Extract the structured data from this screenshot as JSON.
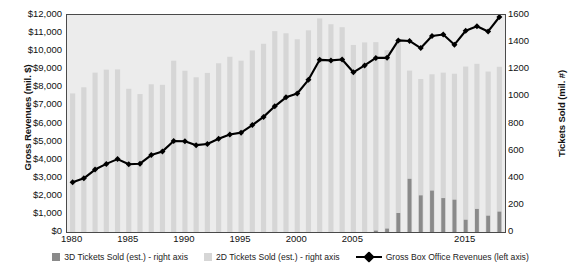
{
  "chart_data": {
    "type": "bar",
    "title": "",
    "subtitle": "",
    "xlabel": "",
    "ylabel": "Gross Revenues (mil. $)",
    "y2label": "Tickets Sold (mil. #)",
    "grid": false,
    "legend_position": "bottom",
    "x": [
      1980,
      1981,
      1982,
      1983,
      1984,
      1985,
      1986,
      1987,
      1988,
      1989,
      1990,
      1991,
      1992,
      1993,
      1994,
      1995,
      1996,
      1997,
      1998,
      1999,
      2000,
      2001,
      2002,
      2003,
      2004,
      2005,
      2006,
      2007,
      2008,
      2009,
      2010,
      2011,
      2012,
      2013,
      2014,
      2015,
      2016,
      2017,
      2018
    ],
    "xtick_labels": [
      "1980",
      "1985",
      "1990",
      "1995",
      "2000",
      "2005",
      "2015"
    ],
    "xticks": [
      1980,
      1985,
      1990,
      1995,
      2000,
      2005,
      2015
    ],
    "ylim": [
      0,
      12000
    ],
    "yticks": [
      0,
      1000,
      2000,
      3000,
      4000,
      5000,
      6000,
      7000,
      8000,
      9000,
      10000,
      11000,
      12000
    ],
    "ytick_labels": [
      "$0",
      "$1,000",
      "$2,000",
      "$3,000",
      "$4,000",
      "$5,000",
      "$6,000",
      "$7,000",
      "$8,000",
      "$9,000",
      "$10,000",
      "$11,000",
      "$12,000"
    ],
    "y2lim": [
      0,
      1600
    ],
    "y2ticks": [
      0,
      200,
      400,
      600,
      800,
      1000,
      1200,
      1400,
      1600
    ],
    "y2tick_labels": [
      "0",
      "200",
      "400",
      "600",
      "800",
      "1000",
      "1200",
      "1400",
      "1600"
    ],
    "series": [
      {
        "name": "2D Tickets Sold (est.) - right axis",
        "type": "bar",
        "axis": "right",
        "color": "#d6d6d6",
        "values": [
          1022,
          1067,
          1175,
          1197,
          1199,
          1056,
          1017,
          1089,
          1085,
          1263,
          1189,
          1141,
          1173,
          1244,
          1292,
          1263,
          1339,
          1388,
          1481,
          1465,
          1421,
          1487,
          1575,
          1532,
          1510,
          1379,
          1398,
          1400,
          1341,
          1419,
          1190,
          1128,
          1163,
          1175,
          1167,
          1220,
          1240,
          1183,
          1218
        ]
      },
      {
        "name": "3D Tickets Sold (est.) - right axis",
        "type": "bar",
        "axis": "right",
        "color": "#8a8a8a",
        "values": [
          0,
          0,
          0,
          0,
          0,
          0,
          0,
          0,
          0,
          0,
          0,
          0,
          0,
          0,
          0,
          0,
          0,
          0,
          0,
          0,
          0,
          0,
          0,
          0,
          0,
          0,
          0,
          10,
          25,
          140,
          392,
          270,
          305,
          250,
          238,
          90,
          170,
          120,
          150
        ]
      },
      {
        "name": "Gross Box Office Revenues (left axis)",
        "type": "line",
        "axis": "left",
        "color": "#000000",
        "marker": "diamond",
        "values": [
          2749,
          2966,
          3453,
          3766,
          4031,
          3749,
          3778,
          4253,
          4458,
          5033,
          5022,
          4803,
          4871,
          5154,
          5396,
          5494,
          5912,
          6366,
          6949,
          7448,
          7661,
          8413,
          9520,
          9489,
          9539,
          8832,
          9209,
          9629,
          9630,
          10596,
          10565,
          10174,
          10837,
          10924,
          10360,
          11128,
          11377,
          11090,
          11890
        ]
      }
    ]
  },
  "legend": {
    "items": [
      {
        "label": "3D Tickets Sold (est.) - right axis",
        "type": "swatch",
        "color": "#8a8a8a"
      },
      {
        "label": "2D Tickets Sold (est.) - right axis",
        "type": "swatch",
        "color": "#d6d6d6"
      },
      {
        "label": "Gross Box Office Revenues (left axis)",
        "type": "line",
        "color": "#000000"
      }
    ]
  }
}
